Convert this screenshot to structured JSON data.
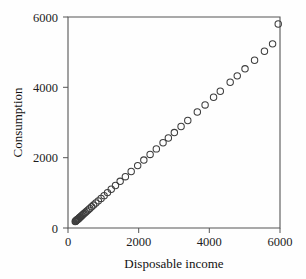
{
  "chart_data": {
    "type": "scatter",
    "title": "",
    "xlabel": "Disposable income",
    "ylabel": "Consumption",
    "xlim": [
      0,
      6000
    ],
    "ylim": [
      0,
      6000
    ],
    "xticks": [
      0,
      2000,
      4000,
      6000
    ],
    "yticks": [
      0,
      2000,
      4000,
      6000
    ],
    "xticklabels": [
      "0",
      "2000",
      "4000",
      "6000"
    ],
    "yticklabels": [
      "0",
      "2000",
      "4000",
      "6000"
    ],
    "grid": false,
    "legend": false,
    "marker": "open-circle",
    "marker_color": "#3d3d3d",
    "marker_size": 3.2,
    "series": [
      {
        "name": "Consumption vs disposable income",
        "points": [
          [
            205,
            185
          ],
          [
            215,
            195
          ],
          [
            228,
            205
          ],
          [
            240,
            218
          ],
          [
            252,
            228
          ],
          [
            266,
            240
          ],
          [
            280,
            252
          ],
          [
            296,
            266
          ],
          [
            312,
            280
          ],
          [
            330,
            296
          ],
          [
            350,
            314
          ],
          [
            372,
            334
          ],
          [
            396,
            356
          ],
          [
            424,
            382
          ],
          [
            455,
            410
          ],
          [
            490,
            442
          ],
          [
            528,
            476
          ],
          [
            570,
            514
          ],
          [
            616,
            556
          ],
          [
            668,
            602
          ],
          [
            724,
            652
          ],
          [
            788,
            710
          ],
          [
            858,
            772
          ],
          [
            936,
            842
          ],
          [
            1022,
            920
          ],
          [
            1118,
            1006
          ],
          [
            1224,
            1102
          ],
          [
            1344,
            1208
          ],
          [
            1476,
            1328
          ],
          [
            1624,
            1460
          ],
          [
            1788,
            1608
          ],
          [
            1972,
            1774
          ],
          [
            2146,
            1932
          ],
          [
            2324,
            2092
          ],
          [
            2500,
            2250
          ],
          [
            2690,
            2424
          ],
          [
            2840,
            2560
          ],
          [
            3010,
            2714
          ],
          [
            3200,
            2886
          ],
          [
            3390,
            3058
          ],
          [
            3660,
            3300
          ],
          [
            3880,
            3500
          ],
          [
            4120,
            3718
          ],
          [
            4310,
            3890
          ],
          [
            4590,
            4144
          ],
          [
            4790,
            4326
          ],
          [
            5010,
            4526
          ],
          [
            5280,
            4770
          ],
          [
            5560,
            5026
          ],
          [
            5790,
            5236
          ],
          [
            5950,
            5800
          ]
        ]
      }
    ]
  },
  "axes": {
    "x_title": "Disposable income",
    "y_title": "Consumption"
  }
}
